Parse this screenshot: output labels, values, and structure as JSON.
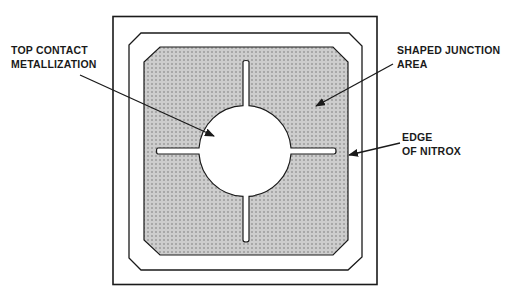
{
  "diagram": {
    "type": "device-layout-top-view",
    "colors": {
      "stroke": "#1a1a1a",
      "fill_hatch_bg": "#b9b9b9",
      "fill_hatch_dot": "#ffffff",
      "background": "#ffffff"
    },
    "labels": {
      "top_contact": {
        "line1": "TOP CONTACT",
        "line2": "METALLIZATION"
      },
      "shaped_junction": {
        "line1": "SHAPED JUNCTION",
        "line2": "AREA"
      },
      "edge_of_nitrox": {
        "line1": "EDGE",
        "line2": "OF NITROX"
      }
    }
  }
}
